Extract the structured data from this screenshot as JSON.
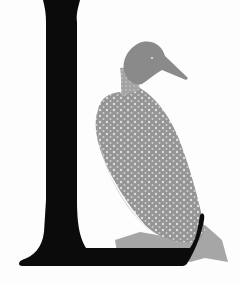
{
  "illustration": {
    "letter": "L",
    "subject": "loon bird",
    "letter_color": "#0a0a0a",
    "bird_color": "#9a9a9a",
    "bird_dark": "#7e7e7e",
    "bird_spots": "#d8d8d8",
    "background": "#fdfdfd"
  }
}
